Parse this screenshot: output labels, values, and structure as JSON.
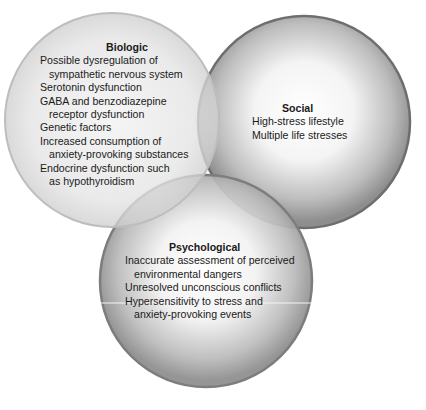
{
  "diagram": {
    "type": "venn",
    "circles": [
      {
        "id": "biologic",
        "title": "Biologic",
        "items": [
          {
            "line1": "Possible dysregulation of",
            "line2": "sympathetic nervous system"
          },
          {
            "line1": "Serotonin dysfunction"
          },
          {
            "line1": "GABA and benzodiazepine",
            "line2": "receptor dysfunction"
          },
          {
            "line1": "Genetic factors"
          },
          {
            "line1": "Increased consumption of",
            "line2": "anxiety-provoking substances"
          },
          {
            "line1": "Endocrine dysfunction such",
            "line2": "as hypothyroidism"
          }
        ]
      },
      {
        "id": "social",
        "title": "Social",
        "items": [
          {
            "line1": "High-stress lifestyle"
          },
          {
            "line1": "Multiple life stresses"
          }
        ]
      },
      {
        "id": "psychological",
        "title": "Psychological",
        "items": [
          {
            "line1": "Inaccurate assessment of perceived",
            "line2": "environmental dangers"
          },
          {
            "line1": "Unresolved unconscious conflicts"
          },
          {
            "line1": "Hypersensitivity to stress and",
            "line2": "anxiety-provoking events"
          }
        ]
      }
    ],
    "colors": {
      "biologic_edge": "#b8b8b8",
      "social_edge": "#6e6e6e",
      "psychological_edge": "#7a7a7a",
      "fill_center": "#ffffff",
      "fill_edge": "#8c8c8c"
    }
  }
}
